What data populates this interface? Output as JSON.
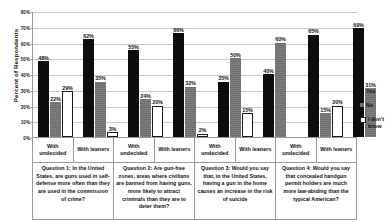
{
  "chart_data": {
    "type": "bar",
    "title": "",
    "xlabel": "",
    "ylabel": "Percent of Respondents",
    "ylim": [
      0,
      80
    ],
    "ytick_labels": [
      "0%",
      "10%",
      "20%",
      "30%",
      "40%",
      "50%",
      "60%",
      "70%",
      "80%"
    ],
    "ytick_values": [
      0,
      10,
      20,
      30,
      40,
      50,
      60,
      70,
      80
    ],
    "grid": true,
    "legend_position": "right",
    "categories": [
      "With undecided",
      "With leaners",
      "With undecided",
      "With leaners",
      "With undecided",
      "With leaners",
      "With undecided",
      "With leaners"
    ],
    "series": [
      {
        "name": "Yes",
        "color": "#0d0d0d",
        "values": [
          48,
          62,
          55,
          66,
          35,
          40,
          65,
          69
        ]
      },
      {
        "name": "No",
        "color": "#6f6f6f",
        "values": [
          22,
          35,
          24,
          32,
          50,
          60,
          15,
          31
        ]
      },
      {
        "name": "I don't know",
        "color": "#ffffff",
        "values": [
          29,
          3,
          20,
          2,
          15,
          0,
          20,
          0
        ]
      }
    ],
    "data_labels": [
      {
        "group": 0,
        "Yes": "48%",
        "No": "22%",
        "I don't know": "29%"
      },
      {
        "group": 1,
        "Yes": "62%",
        "No": "35%",
        "I don't know": "3%"
      },
      {
        "group": 2,
        "Yes": "55%",
        "No": "24%",
        "I don't know": "20%"
      },
      {
        "group": 3,
        "Yes": "66%",
        "No": "32%",
        "I don't know": "2%"
      },
      {
        "group": 4,
        "Yes": "35%",
        "No": "50%",
        "I don't know": "15%"
      },
      {
        "group": 5,
        "Yes": "40%",
        "No": "60%",
        "I don't know": ""
      },
      {
        "group": 6,
        "Yes": "65%",
        "No": "15%",
        "I don't know": "20%"
      },
      {
        "group": 7,
        "Yes": "69%",
        "No": "31%",
        "I don't know": ""
      }
    ],
    "questions": [
      "Question 1: In the United States, are guns used in self-defense more often than they are used in the commission of crime?",
      "Question 2: Are gun-free zones, areas where civilians are banned from having guns, more likely to attract criminals than they are to deter them?",
      "Question 3: Would you say that, in the United States, having a gun in the home causes an increase in the risk of suicide",
      "Question 4: Would you say that concealed handgun permit holders are much more law-abiding than the typical American?"
    ]
  },
  "legend": {
    "items": [
      {
        "label": "Yes",
        "swatch": "yes"
      },
      {
        "label": "No",
        "swatch": "no"
      },
      {
        "label": "I don't know",
        "swatch": "dk"
      }
    ]
  }
}
